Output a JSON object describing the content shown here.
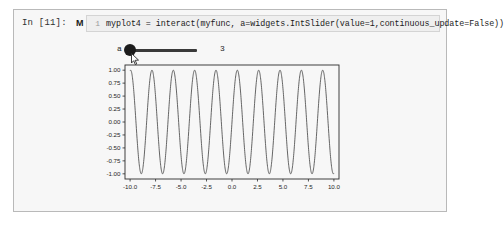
{
  "notebook": {
    "prompt_label": "In [11]:",
    "run_marker_icon": "run-cell-marker-icon",
    "run_marker_glyph": "M",
    "line_number": "1",
    "code": "myplot4 = interact(myfunc, a=widgets.IntSlider(value=1,continuous_update=False))"
  },
  "widget": {
    "label": "a",
    "value_display": "3",
    "handle_icon": "slider-handle-icon",
    "cursor_icon": "mouse-pointer-icon"
  },
  "colors": {
    "cell_background": "#f7f7f7",
    "cell_border": "#b9b9b9",
    "code_background": "#efefef",
    "slider_track": "#3a3a3a",
    "slider_handle": "#1c1c1c",
    "plot_line": "#4a4a4a",
    "axis": "#2b2b2b",
    "page_background": "#ffffff"
  },
  "chart_data": {
    "type": "line",
    "title": "",
    "xlabel": "",
    "ylabel": "",
    "xlim": [
      -10.5,
      10.5
    ],
    "ylim": [
      -1.1,
      1.1
    ],
    "grid": false,
    "legend": false,
    "xticks": [
      "-10.0",
      "-7.5",
      "-5.0",
      "-2.5",
      "0.0",
      "2.5",
      "5.0",
      "7.5",
      "10.0"
    ],
    "xtick_values": [
      -10.0,
      -7.5,
      -5.0,
      -2.5,
      0.0,
      2.5,
      5.0,
      7.5,
      10.0
    ],
    "yticks": [
      "1.00",
      "0.75",
      "0.50",
      "0.25",
      "0.00",
      "-0.25",
      "-0.50",
      "-0.75",
      "-1.00"
    ],
    "ytick_values": [
      1.0,
      0.75,
      0.5,
      0.25,
      0.0,
      -0.25,
      -0.5,
      -0.75,
      -1.0
    ],
    "series": [
      {
        "name": "sin(3x)",
        "function": "sin",
        "amplitude": 1.0,
        "frequency": 3.0,
        "x_start": -10.0,
        "x_end": 10.0,
        "samples": 1200
      }
    ]
  }
}
